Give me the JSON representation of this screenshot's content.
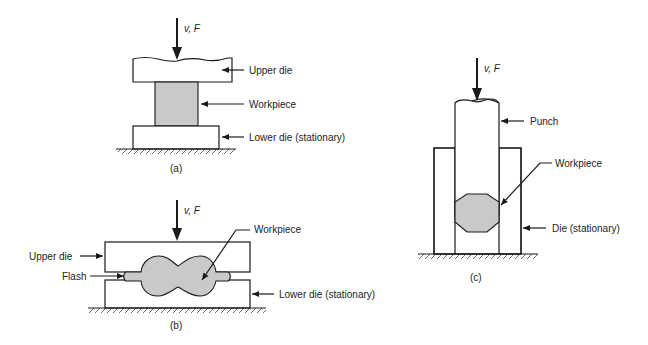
{
  "figure": {
    "panels": [
      {
        "id": "a",
        "caption": "(a)",
        "force_label": "v, F",
        "labels": {
          "upper_die": "Upper die",
          "workpiece": "Workpiece",
          "lower_die": "Lower die (stationary)"
        }
      },
      {
        "id": "b",
        "caption": "(b)",
        "force_label": "v, F",
        "labels": {
          "upper_die": "Upper die",
          "flash": "Flash",
          "workpiece": "Workpiece",
          "lower_die": "Lower die (stationary)"
        }
      },
      {
        "id": "c",
        "caption": "(c)",
        "force_label": "v, F",
        "labels": {
          "punch": "Punch",
          "workpiece": "Workpiece",
          "die": "Die (stationary)"
        }
      }
    ],
    "colors": {
      "line": "#1a1a1a",
      "workpiece_fill": "#c9c9c9",
      "background": "#ffffff"
    }
  }
}
